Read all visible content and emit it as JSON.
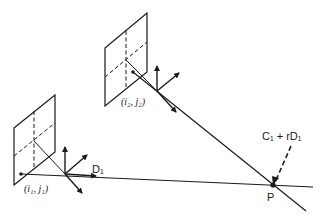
{
  "diagram": {
    "type": "stereo-triangulation",
    "labels": {
      "pixel1": "(i₁, j₁)",
      "pixel2": "(i₂, j₂)",
      "direction": "D₁",
      "ray_expr": "C₁ + rD₁",
      "point": "P"
    },
    "colors": {
      "stroke": "#1a1a1a",
      "background": "#ffffff"
    },
    "cameras": [
      {
        "name": "camera-1",
        "origin": [
          65,
          174
        ],
        "plane": [
          [
            14,
            128
          ],
          [
            55,
            95
          ],
          [
            55,
            152
          ],
          [
            14,
            185
          ]
        ],
        "pixel": [
          21,
          174
        ]
      },
      {
        "name": "camera-2",
        "origin": [
          157,
          91
        ],
        "plane": [
          [
            105,
            48
          ],
          [
            147,
            13
          ],
          [
            147,
            72
          ],
          [
            105,
            106
          ]
        ],
        "pixel": [
          133,
          72
        ]
      }
    ],
    "point_P": [
      273,
      185
    ]
  }
}
